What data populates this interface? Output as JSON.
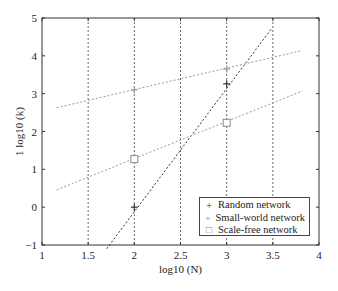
{
  "chart_data": {
    "type": "line",
    "title": "",
    "xlabel": "log10 (N)",
    "ylabel": "1 log10 (k)",
    "xlim": [
      1,
      4
    ],
    "ylim": [
      -1,
      5
    ],
    "xticks": [
      "1",
      "1.5",
      "2",
      "2.5",
      "3",
      "3.5",
      "4"
    ],
    "yticks": [
      "−1",
      "0",
      "1",
      "2",
      "3",
      "4",
      "5"
    ],
    "grid": "vertical dashed lines at x = 1.5, 2, 2.5, 3, 3.5",
    "legend_position": "lower right",
    "series": [
      {
        "name": "Random network",
        "marker": "+",
        "color": "#333333",
        "points": [
          {
            "x": 2,
            "y": 0.0
          },
          {
            "x": 3,
            "y": 3.26
          }
        ],
        "fit_line": [
          {
            "x": 1.7,
            "y": -1.1
          },
          {
            "x": 3.48,
            "y": 4.7
          }
        ]
      },
      {
        "name": "Small-world network",
        "marker": "+",
        "color": "#999999",
        "points": [
          {
            "x": 2,
            "y": 3.1
          },
          {
            "x": 3,
            "y": 3.65
          }
        ],
        "fit_line": [
          {
            "x": 1.16,
            "y": 2.63
          },
          {
            "x": 3.8,
            "y": 4.13
          }
        ]
      },
      {
        "name": "Scale-free network",
        "marker": "square",
        "color": "#999999",
        "points": [
          {
            "x": 2,
            "y": 1.27
          },
          {
            "x": 3,
            "y": 2.23
          }
        ],
        "fit_line": [
          {
            "x": 1.16,
            "y": 0.46
          },
          {
            "x": 3.82,
            "y": 3.07
          }
        ]
      }
    ]
  },
  "legend": {
    "items": [
      {
        "marker": "+",
        "label": "Random network"
      },
      {
        "marker": "+",
        "label": "Small-world network"
      },
      {
        "marker": "□",
        "label": "Scale-free network"
      }
    ]
  }
}
